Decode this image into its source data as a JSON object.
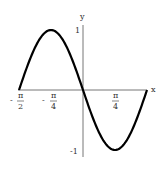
{
  "chart_data": {
    "type": "line",
    "title": "",
    "function": "y = -sin(2x)",
    "xlabel": "x",
    "ylabel": "y",
    "xlim": [
      -1.5708,
      1.5708
    ],
    "ylim": [
      -1,
      1
    ],
    "grid": false,
    "x_ticks": [
      {
        "value": -1.5708,
        "label": "-π/2",
        "sign": "-",
        "num": "π",
        "den": "2"
      },
      {
        "value": -0.7854,
        "label": "-π/4",
        "sign": "-",
        "num": "π",
        "den": "4"
      },
      {
        "value": 0.7854,
        "label": "π/4",
        "sign": "",
        "num": "π",
        "den": "4"
      }
    ],
    "y_ticks": [
      {
        "value": 1,
        "label": "1"
      },
      {
        "value": -1,
        "label": "-1"
      }
    ],
    "series": [
      {
        "name": "y = -sin(2x)",
        "x": [
          -1.5708,
          -1.1781,
          -0.7854,
          -0.3927,
          0,
          0.3927,
          0.7854,
          1.1781,
          1.5708
        ],
        "y": [
          0,
          0.7071,
          1,
          0.7071,
          0,
          -0.7071,
          -1,
          -0.7071,
          0
        ]
      }
    ]
  }
}
